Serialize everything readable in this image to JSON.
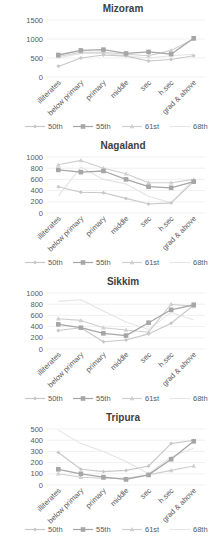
{
  "categories": [
    "illiterates",
    "below primary",
    "primary",
    "middle",
    "sec",
    "h.sec",
    "grad  & above"
  ],
  "legend": [
    {
      "name": "50th",
      "color": "#c8c8c8",
      "marker": "diamond"
    },
    {
      "name": "55th",
      "color": "#a6a6a6",
      "marker": "square"
    },
    {
      "name": "61st",
      "color": "#cfcfcf",
      "marker": "triangle"
    },
    {
      "name": "68th",
      "color": "#e4e4e4",
      "marker": "none"
    }
  ],
  "chart_data": [
    {
      "type": "line",
      "title": "Mizoram",
      "xlabel": "",
      "ylabel": "",
      "ylim": [
        0,
        1500
      ],
      "yticks": [
        0,
        500,
        1000,
        1500
      ],
      "grid": true,
      "legend_position": "bottom",
      "categories": [
        "illiterates",
        "below primary",
        "primary",
        "middle",
        "sec",
        "h.sec",
        "grad  & above"
      ],
      "series": [
        {
          "name": "50th",
          "values": [
            280,
            500,
            580,
            550,
            420,
            460,
            560
          ]
        },
        {
          "name": "55th",
          "values": [
            580,
            700,
            720,
            620,
            660,
            600,
            1020
          ]
        },
        {
          "name": "61st",
          "values": [
            540,
            650,
            650,
            600,
            560,
            700,
            1000
          ]
        },
        {
          "name": "68th",
          "values": [
            500,
            620,
            620,
            560,
            500,
            560,
            600
          ]
        }
      ]
    },
    {
      "type": "line",
      "title": "Nagaland",
      "xlabel": "",
      "ylabel": "",
      "ylim": [
        0,
        1000
      ],
      "yticks": [
        0,
        200,
        400,
        600,
        800,
        1000
      ],
      "grid": true,
      "legend_position": "bottom",
      "categories": [
        "illiterates",
        "below primary",
        "primary",
        "middle",
        "sec",
        "h.sec",
        "grad  & above"
      ],
      "series": [
        {
          "name": "50th",
          "values": [
            470,
            370,
            360,
            260,
            160,
            180,
            560
          ]
        },
        {
          "name": "55th",
          "values": [
            770,
            730,
            750,
            600,
            470,
            450,
            560
          ]
        },
        {
          "name": "61st",
          "values": [
            860,
            940,
            800,
            700,
            540,
            540,
            600
          ]
        },
        {
          "name": "68th",
          "values": [
            300,
            820,
            600,
            520,
            300,
            180,
            600
          ]
        }
      ]
    },
    {
      "type": "line",
      "title": "Sikkim",
      "xlabel": "",
      "ylabel": "",
      "ylim": [
        0,
        1000
      ],
      "yticks": [
        0,
        200,
        400,
        600,
        800,
        1000
      ],
      "grid": true,
      "legend_position": "bottom",
      "categories": [
        "illiterates",
        "below primary",
        "primary",
        "middle",
        "sec",
        "h.sec",
        "grad  & above"
      ],
      "series": [
        {
          "name": "50th",
          "values": [
            330,
            380,
            130,
            160,
            270,
            460,
            780
          ]
        },
        {
          "name": "55th",
          "values": [
            440,
            380,
            280,
            240,
            470,
            700,
            790
          ]
        },
        {
          "name": "61st",
          "values": [
            540,
            510,
            380,
            340,
            300,
            800,
            760
          ]
        },
        {
          "name": "68th",
          "values": [
            850,
            880,
            680,
            480,
            350,
            650,
            520
          ]
        }
      ]
    },
    {
      "type": "line",
      "title": "Tripura",
      "xlabel": "",
      "ylabel": "",
      "ylim": [
        0,
        500
      ],
      "yticks": [
        0,
        100,
        200,
        300,
        400,
        500
      ],
      "grid": true,
      "legend_position": "bottom",
      "categories": [
        "illiterates",
        "below primary",
        "primary",
        "middle",
        "sec",
        "h.sec",
        "grad  & above"
      ],
      "series": [
        {
          "name": "50th",
          "values": [
            290,
            140,
            120,
            130,
            170,
            370,
            400
          ]
        },
        {
          "name": "55th",
          "values": [
            140,
            100,
            70,
            50,
            90,
            230,
            390
          ]
        },
        {
          "name": "61st",
          "values": [
            100,
            70,
            60,
            60,
            90,
            130,
            170
          ]
        },
        {
          "name": "68th",
          "values": [
            490,
            370,
            300,
            210,
            100,
            250,
            330
          ]
        }
      ]
    }
  ]
}
